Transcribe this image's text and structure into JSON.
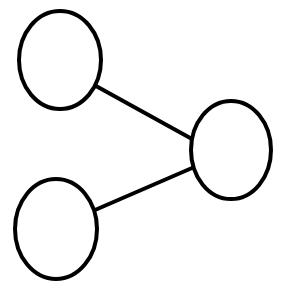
{
  "diagram": {
    "type": "graph",
    "background": "#ffffff",
    "stroke_color": "#000000",
    "stroke_width": 4,
    "nodes": [
      {
        "id": "node-top-left",
        "cx": 60,
        "cy": 60,
        "rx": 41,
        "ry": 49,
        "label": ""
      },
      {
        "id": "node-right",
        "cx": 231,
        "cy": 150,
        "rx": 40,
        "ry": 49,
        "label": ""
      },
      {
        "id": "node-bottom-left",
        "cx": 56,
        "cy": 229,
        "rx": 41,
        "ry": 50,
        "label": ""
      }
    ],
    "edges": [
      {
        "from": "node-top-left",
        "to": "node-right",
        "x1": 96,
        "y1": 86,
        "x2": 192,
        "y2": 139
      },
      {
        "from": "node-bottom-left",
        "to": "node-right",
        "x1": 95,
        "y1": 210,
        "x2": 192,
        "y2": 168
      }
    ]
  }
}
